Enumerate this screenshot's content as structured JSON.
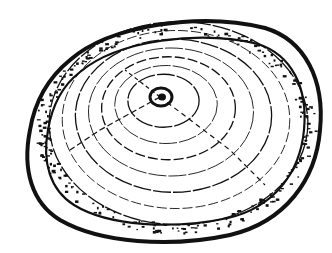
{
  "image": {
    "subject": "Tree trunk cross-section showing growth rings",
    "style": "black ink line drawing with stippling",
    "colors": {
      "ink": "#111111",
      "paper": "#ffffff"
    },
    "ring_count": 7
  }
}
